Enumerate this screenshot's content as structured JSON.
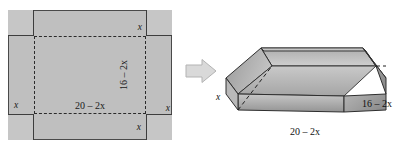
{
  "figure": {
    "colors": {
      "sheet_fill": "#bfbfbf",
      "corner_fill": "#c6c6c6",
      "outline": "#4a4a4a",
      "fold_line": "#2b2b2b",
      "arrow_fill": "#d9d9d9",
      "arrow_stroke": "#b0b0b0",
      "box_light": "#d2d2d2",
      "box_mid": "#a8a8a8",
      "box_dark": "#8d8d8d",
      "box_outline": "#2e2e2e"
    }
  },
  "sheet": {
    "label_x_top": "x",
    "label_x_right": "x",
    "label_x_left": "x",
    "label_x_bottom": "x",
    "label_width": "20 – 2x",
    "label_height": "16 – 2x"
  },
  "arrow": {
    "name": "transformation-arrow",
    "direction": "right"
  },
  "box": {
    "label_length": "20 – 2x",
    "label_width": "16 – 2x",
    "label_height": "x"
  }
}
